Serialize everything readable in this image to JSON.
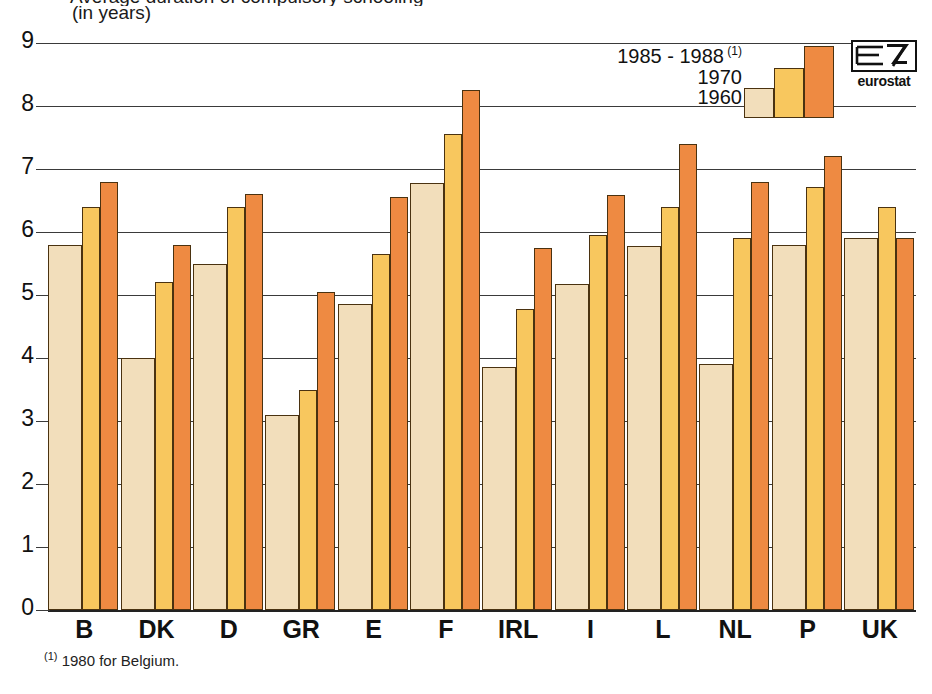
{
  "title_cropped": "Average duration of compulsory schooling",
  "subtitle": "(in years)",
  "footnote": "1980 for Belgium.",
  "footnote_marker": "(1)",
  "logo": {
    "text": "eurostat",
    "name": "eurostat-logo"
  },
  "legend": {
    "items": [
      {
        "label": "1985 - 1988",
        "marker": "(1)",
        "color": "#ee8a42",
        "name": "legend-1985-1988"
      },
      {
        "label": "1970",
        "marker": "",
        "color": "#f8c75e",
        "name": "legend-1970"
      },
      {
        "label": "1960",
        "marker": "",
        "color": "#f2debb",
        "name": "legend-1960"
      }
    ]
  },
  "colors": {
    "series_1960": "#f2debb",
    "series_1970": "#f8c75e",
    "series_1985_1988": "#ee8a42",
    "outline": "#4a3210",
    "grid": "#3a3a3a",
    "background": "#ffffff"
  },
  "chart_data": {
    "type": "bar",
    "title": "Average duration of compulsory schooling",
    "subtitle": "(in years)",
    "xlabel": "",
    "ylabel": "(in years)",
    "ylim": [
      0,
      9
    ],
    "yticks": [
      0,
      1,
      2,
      3,
      4,
      5,
      6,
      7,
      8,
      9
    ],
    "ytick_labels": [
      "0",
      "1",
      "2",
      "3",
      "4",
      "5",
      "6",
      "7",
      "8",
      "9"
    ],
    "grid": true,
    "legend_position": "top-right",
    "categories": [
      "B",
      "DK",
      "D",
      "GR",
      "E",
      "F",
      "IRL",
      "I",
      "L",
      "NL",
      "P",
      "UK"
    ],
    "series": [
      {
        "name": "1960",
        "color": "#f2debb",
        "values": [
          5.8,
          4.0,
          5.5,
          3.1,
          4.85,
          6.78,
          3.85,
          5.18,
          5.78,
          3.9,
          5.8,
          5.9
        ]
      },
      {
        "name": "1970",
        "color": "#f8c75e",
        "values": [
          6.4,
          5.2,
          6.4,
          3.5,
          5.65,
          7.55,
          4.78,
          5.95,
          6.4,
          5.9,
          6.72,
          6.4
        ]
      },
      {
        "name": "1985 - 1988",
        "color": "#ee8a42",
        "values": [
          6.8,
          5.8,
          6.6,
          5.05,
          6.55,
          8.25,
          5.75,
          6.58,
          7.4,
          6.8,
          7.2,
          5.9
        ]
      }
    ],
    "annotations": [
      "(1) 1980 for Belgium."
    ]
  }
}
